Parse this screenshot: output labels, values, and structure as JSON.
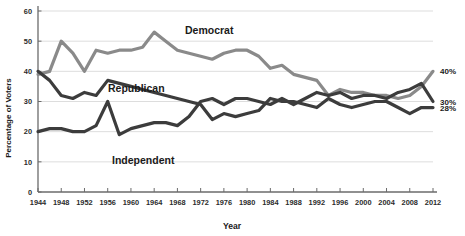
{
  "chart_data": {
    "type": "line",
    "title": "",
    "xlabel": "Year",
    "ylabel": "Percentage of Voters",
    "xlim": [
      1944,
      2012
    ],
    "ylim": [
      0,
      60
    ],
    "grid": true,
    "legend_position": "inline-annotations",
    "y_ticks": [
      0,
      10,
      20,
      30,
      40,
      50,
      60
    ],
    "y_tick_labels": [
      "0",
      "10",
      "20",
      "30",
      "40",
      "50",
      "60"
    ],
    "x_ticks": [
      1944,
      1948,
      1952,
      1956,
      1960,
      1964,
      1968,
      1972,
      1976,
      1980,
      1984,
      1988,
      1992,
      1996,
      2000,
      2004,
      2008,
      2012
    ],
    "x_tick_labels": [
      "1944",
      "1948",
      "1952",
      "1956",
      "1960",
      "1964",
      "1968",
      "1972",
      "1976",
      "1980",
      "1984",
      "1988",
      "1992",
      "1996",
      "2000",
      "2004",
      "2008",
      "2012"
    ],
    "x": [
      1944,
      1946,
      1948,
      1950,
      1952,
      1954,
      1956,
      1958,
      1960,
      1962,
      1964,
      1966,
      1968,
      1970,
      1972,
      1974,
      1976,
      1978,
      1980,
      1982,
      1984,
      1986,
      1988,
      1990,
      1992,
      1994,
      1996,
      1998,
      2000,
      2002,
      2004,
      2006,
      2008,
      2010,
      2012
    ],
    "series": [
      {
        "name": "Democrat",
        "color": "#8a8a8a",
        "end_label": "40%",
        "values": [
          39,
          40,
          50,
          46,
          40,
          47,
          46,
          47,
          47,
          48,
          53,
          50,
          47,
          46,
          45,
          44,
          46,
          47,
          47,
          45,
          41,
          42,
          39,
          38,
          37,
          32,
          34,
          33,
          33,
          32,
          32,
          31,
          32,
          35,
          40
        ]
      },
      {
        "name": "Republican",
        "color": "#3c3c3c",
        "end_label": "28%",
        "values": [
          40,
          37,
          32,
          31,
          33,
          32,
          37,
          36,
          35,
          34,
          33,
          32,
          31,
          30,
          29,
          24,
          26,
          25,
          26,
          27,
          31,
          30,
          30,
          29,
          28,
          31,
          29,
          28,
          29,
          30,
          30,
          28,
          26,
          28,
          28
        ]
      },
      {
        "name": "Independent",
        "color": "#3c3c3c",
        "end_label": "30%",
        "values": [
          20,
          21,
          21,
          20,
          20,
          22,
          30,
          19,
          21,
          22,
          23,
          23,
          22,
          25,
          30,
          31,
          29,
          31,
          31,
          30,
          29,
          31,
          29,
          31,
          33,
          32,
          33,
          31,
          32,
          32,
          31,
          33,
          34,
          36,
          30
        ]
      }
    ]
  },
  "annotations": {
    "democrat_label": "Democrat",
    "republican_label": "Republican",
    "independent_label": "Independent"
  }
}
